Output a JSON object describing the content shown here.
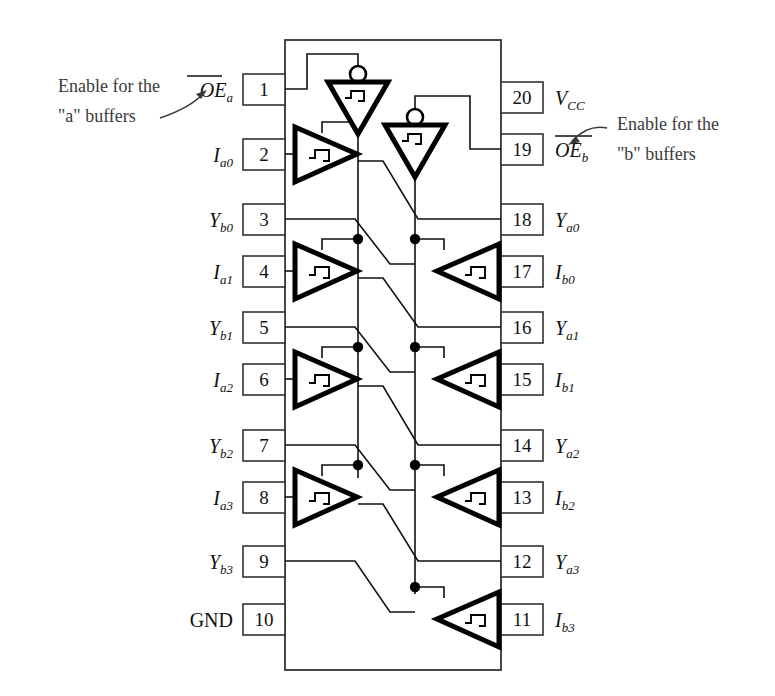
{
  "figure": {
    "device_style": "20-pin DIP logic symbol"
  },
  "annotations": [
    {
      "id": "left-callout",
      "line1": "Enable for the",
      "line2": "\"a\" buffers",
      "target": "pin-1"
    },
    {
      "id": "right-callout",
      "line1": "Enable for the",
      "line2": "\"b\" buffers",
      "target": "pin-19"
    }
  ],
  "pins_left": [
    {
      "num": "1",
      "base": "OE",
      "sub": "a",
      "overbar": true,
      "italic": true
    },
    {
      "num": "2",
      "base": "I",
      "sub": "a0",
      "overbar": false,
      "italic": true
    },
    {
      "num": "3",
      "base": "Y",
      "sub": "b0",
      "overbar": false,
      "italic": true
    },
    {
      "num": "4",
      "base": "I",
      "sub": "a1",
      "overbar": false,
      "italic": true
    },
    {
      "num": "5",
      "base": "Y",
      "sub": "b1",
      "overbar": false,
      "italic": true
    },
    {
      "num": "6",
      "base": "I",
      "sub": "a2",
      "overbar": false,
      "italic": true
    },
    {
      "num": "7",
      "base": "Y",
      "sub": "b2",
      "overbar": false,
      "italic": true
    },
    {
      "num": "8",
      "base": "I",
      "sub": "a3",
      "overbar": false,
      "italic": true
    },
    {
      "num": "9",
      "base": "Y",
      "sub": "b3",
      "overbar": false,
      "italic": true
    },
    {
      "num": "10",
      "base": "GND",
      "sub": "",
      "overbar": false,
      "italic": false
    }
  ],
  "pins_right": [
    {
      "num": "20",
      "base": "V",
      "sub": "CC",
      "overbar": false,
      "italic": true
    },
    {
      "num": "19",
      "base": "OE",
      "sub": "b",
      "overbar": true,
      "italic": true
    },
    {
      "num": "18",
      "base": "Y",
      "sub": "a0",
      "overbar": false,
      "italic": true
    },
    {
      "num": "17",
      "base": "I",
      "sub": "b0",
      "overbar": false,
      "italic": true
    },
    {
      "num": "16",
      "base": "Y",
      "sub": "a1",
      "overbar": false,
      "italic": true
    },
    {
      "num": "15",
      "base": "I",
      "sub": "b1",
      "overbar": false,
      "italic": true
    },
    {
      "num": "14",
      "base": "Y",
      "sub": "a2",
      "overbar": false,
      "italic": true
    },
    {
      "num": "13",
      "base": "I",
      "sub": "b2",
      "overbar": false,
      "italic": true
    },
    {
      "num": "12",
      "base": "Y",
      "sub": "a3",
      "overbar": false,
      "italic": true
    },
    {
      "num": "11",
      "base": "I",
      "sub": "b3",
      "overbar": false,
      "italic": true
    }
  ],
  "gates": {
    "inverters": [
      {
        "id": "inv-a",
        "label": "a-enable-inverter",
        "direction": "down",
        "bubble": "top"
      },
      {
        "id": "inv-b",
        "label": "b-enable-inverter",
        "direction": "down",
        "bubble": "top"
      }
    ],
    "buffers_a": [
      {
        "id": "buf-a0",
        "direction": "right"
      },
      {
        "id": "buf-a1",
        "direction": "right"
      },
      {
        "id": "buf-a2",
        "direction": "right"
      },
      {
        "id": "buf-a3",
        "direction": "right"
      }
    ],
    "buffers_b": [
      {
        "id": "buf-b0",
        "direction": "left"
      },
      {
        "id": "buf-b1",
        "direction": "left"
      },
      {
        "id": "buf-b2",
        "direction": "left"
      },
      {
        "id": "buf-b3",
        "direction": "left"
      }
    ],
    "symbol_inside": "three-state-hysteresis-marker"
  },
  "colors": {
    "ink": "#111111",
    "outline": "#333333",
    "callout_text": "#3a3a3a",
    "background": "#ffffff"
  }
}
